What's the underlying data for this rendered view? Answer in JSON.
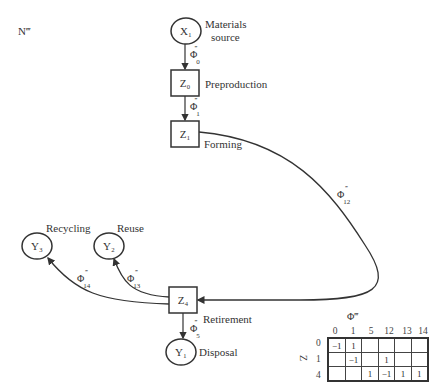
{
  "figure": {
    "corner_label": "N‴",
    "nodes": [
      {
        "id": "X1",
        "shape": "circle",
        "text": "X₁",
        "label": "Materials source",
        "label_lines": [
          "Materials",
          "source"
        ]
      },
      {
        "id": "Z0",
        "shape": "square",
        "text": "Z₀",
        "label": "Preproduction"
      },
      {
        "id": "Z1",
        "shape": "square",
        "text": "Z₁",
        "label": "Forming"
      },
      {
        "id": "Z4",
        "shape": "square",
        "text": "Z₄",
        "label": "Retirement"
      },
      {
        "id": "Y1",
        "shape": "circle",
        "text": "Y₁",
        "label": "Disposal"
      },
      {
        "id": "Y2",
        "shape": "circle",
        "text": "Y₂",
        "label": "Reuse"
      },
      {
        "id": "Y3",
        "shape": "circle",
        "text": "Y₃",
        "label": "Recycling"
      }
    ],
    "edges": [
      {
        "from": "X1",
        "to": "Z0",
        "phi": "Φ",
        "sub": "0",
        "sup": "‴"
      },
      {
        "from": "Z0",
        "to": "Z1",
        "phi": "Φ",
        "sub": "1",
        "sup": "‴"
      },
      {
        "from": "Z1",
        "to": "Z4",
        "phi": "Φ",
        "sub": "12",
        "sup": "‴"
      },
      {
        "from": "Z4",
        "to": "Y2",
        "phi": "Φ",
        "sub": "13",
        "sup": "‴"
      },
      {
        "from": "Z4",
        "to": "Y3",
        "phi": "Φ",
        "sub": "14",
        "sup": "‴"
      },
      {
        "from": "Z4",
        "to": "Y1",
        "phi": "Φ",
        "sub": "5",
        "sup": "‴"
      }
    ],
    "matrix": {
      "title": "Φ‴",
      "row_axis": "Z",
      "columns": [
        "0",
        "1",
        "5",
        "12",
        "13",
        "14"
      ],
      "rows": [
        {
          "label": "0",
          "cells": [
            "−1",
            "1",
            "",
            "",
            "",
            ""
          ]
        },
        {
          "label": "1",
          "cells": [
            "",
            "−1",
            "",
            "1",
            "",
            ""
          ]
        },
        {
          "label": "4",
          "cells": [
            "",
            "",
            "1",
            "−1",
            "1",
            "1"
          ]
        }
      ]
    }
  }
}
